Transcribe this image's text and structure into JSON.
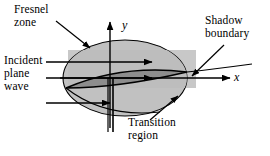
{
  "figure": {
    "background_color": "#ffffff",
    "stroke_color": "#000000",
    "band_fill": "#c8c8c8",
    "zone_fill": "#c0c0c0",
    "transition_fill": "#8a8a8a"
  },
  "labels": {
    "fresnel_zone": "Fresnel\nzone",
    "incident_plane_wave": "Incident\nplane\nwave",
    "shadow_boundary": "Shadow\nboundary",
    "transition_region": "Transition\nregion"
  },
  "axes": {
    "y_label": "y",
    "x_label": "x",
    "origin": {
      "x": 110,
      "y": 78
    },
    "x_axis_end": {
      "x": 228,
      "y": 78
    },
    "y_axis_end": {
      "x": 110,
      "y": 20
    }
  },
  "elements": {
    "incident_arrows": [
      {
        "name": "upper-incident-arrow",
        "x1": 46,
        "y1": 62,
        "x2": 150,
        "y2": 62
      },
      {
        "name": "middle-incident-arrow",
        "x1": 46,
        "y1": 78,
        "x2": 150,
        "y2": 78
      },
      {
        "name": "lower-incident-arrow",
        "x1": 46,
        "y1": 103,
        "x2": 108,
        "y2": 103
      }
    ],
    "leaders": [
      {
        "name": "fresnel-zone-leader",
        "x1": 56,
        "y1": 22,
        "x2": 89,
        "y2": 47
      },
      {
        "name": "shadow-boundary-leader",
        "x1": 222,
        "y1": 47,
        "x2": 192,
        "y2": 76
      },
      {
        "name": "transition-region-leader",
        "x1": 151,
        "y1": 119,
        "x2": 177,
        "y2": 97
      }
    ],
    "screen_line": {
      "name": "half-plane-screen",
      "x": 110,
      "y_top": 78,
      "y_bottom": 130
    }
  }
}
